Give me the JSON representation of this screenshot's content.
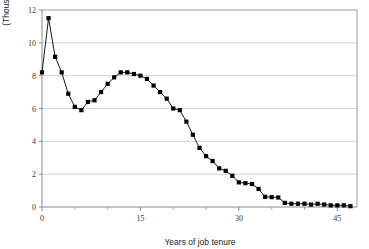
{
  "chart_data": {
    "type": "line",
    "title": "",
    "subtitle": "",
    "xlabel": "Years of job tenure",
    "ylabel": "(Thousands)",
    "xlim": [
      0,
      48
    ],
    "ylim": [
      0,
      12
    ],
    "xticks": [
      0,
      15,
      30,
      45
    ],
    "xtick_labels": [
      "0",
      "15",
      "30",
      "45"
    ],
    "xminor_ticks": [
      5,
      10,
      20,
      25,
      35,
      40
    ],
    "yticks": [
      0,
      2,
      4,
      6,
      8,
      10,
      12
    ],
    "ytick_labels": [
      "0",
      "2",
      "4",
      "6",
      "8",
      "10",
      "12"
    ],
    "grid": "horizontal",
    "legend": "none",
    "marker": "filled-square",
    "line_color": "#000000",
    "marker_color": "#000000",
    "grid_color": "#c8c8c8",
    "axis_color": "#808080",
    "x": [
      0,
      1,
      2,
      3,
      4,
      5,
      6,
      7,
      8,
      9,
      10,
      11,
      12,
      13,
      14,
      15,
      16,
      17,
      18,
      19,
      20,
      21,
      22,
      23,
      24,
      25,
      26,
      27,
      28,
      29,
      30,
      31,
      32,
      33,
      34,
      35,
      36,
      37,
      38,
      39,
      40,
      41,
      42,
      43,
      44,
      45,
      46,
      47
    ],
    "values": [
      8.2,
      11.5,
      9.15,
      8.2,
      6.9,
      6.1,
      5.9,
      6.4,
      6.5,
      7.0,
      7.5,
      7.9,
      8.2,
      8.2,
      8.1,
      8.0,
      7.8,
      7.4,
      7.0,
      6.6,
      6.0,
      5.9,
      5.2,
      4.4,
      3.6,
      3.1,
      2.8,
      2.35,
      2.2,
      1.9,
      1.5,
      1.45,
      1.4,
      1.1,
      0.62,
      0.6,
      0.58,
      0.25,
      0.2,
      0.2,
      0.2,
      0.15,
      0.2,
      0.15,
      0.1,
      0.1,
      0.1,
      0.05
    ],
    "series": [
      {
        "name": "Years of job tenure distribution",
        "values": [
          8.2,
          11.5,
          9.15,
          8.2,
          6.9,
          6.1,
          5.9,
          6.4,
          6.5,
          7.0,
          7.5,
          7.9,
          8.2,
          8.2,
          8.1,
          8.0,
          7.8,
          7.4,
          7.0,
          6.6,
          6.0,
          5.9,
          5.2,
          4.4,
          3.6,
          3.1,
          2.8,
          2.35,
          2.2,
          1.9,
          1.5,
          1.45,
          1.4,
          1.1,
          0.62,
          0.6,
          0.58,
          0.25,
          0.2,
          0.2,
          0.2,
          0.15,
          0.2,
          0.15,
          0.1,
          0.1,
          0.1,
          0.05
        ]
      }
    ]
  }
}
